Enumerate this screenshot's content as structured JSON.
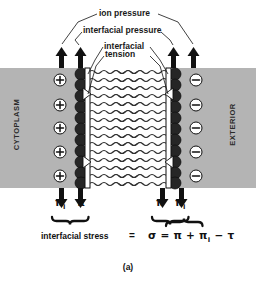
{
  "figure": {
    "caption": "(a)",
    "callouts": {
      "ion_pressure": "ion pressure",
      "interfacial_pressure": "interfacial pressure",
      "interfacial_tension_line1": "interfacial",
      "interfacial_tension_line2": "tension"
    },
    "regions": {
      "left": "CYTOPLASM",
      "right": "EXTERIOR"
    },
    "charges": {
      "cytoplasm_sign": "+",
      "exterior_sign": "−",
      "cytoplasm_count": 5,
      "exterior_count": 5
    },
    "arrows": {
      "up_count": 4,
      "down_count": 4,
      "up_direction": "up",
      "down_direction": "down"
    },
    "force_labels": {
      "left_outer": "π",
      "left_outer_sub": "I",
      "left_inner": "π",
      "right_inner": "π",
      "right_outer": "π",
      "right_outer_sub": "I"
    },
    "equation": {
      "name": "interfacial stress",
      "equals": "=",
      "expression_sigma": "σ",
      "expression_rest": " = π + π",
      "expression_sub": "I",
      "expression_tail": " − τ",
      "full": "σ = π + πI − τ"
    },
    "colors": {
      "background": "#ffffff",
      "membrane_band": "#b4b4b4",
      "lipid_head": "#262626",
      "ink": "#1a1a1a",
      "tail_stroke": "#333333"
    },
    "geometry": {
      "band_x": 14,
      "band_y": 68,
      "band_width": 228,
      "band_height": 120
    }
  }
}
